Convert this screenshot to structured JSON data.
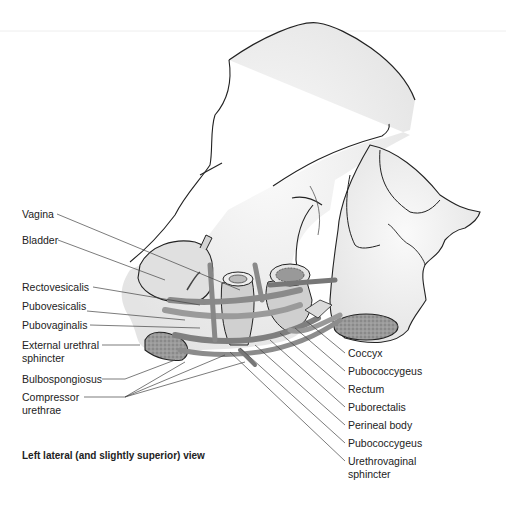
{
  "figure": {
    "caption": "Left lateral (and slightly superior) view",
    "labels_left": [
      {
        "text": "Vagina"
      },
      {
        "text": "Bladder"
      },
      {
        "text": "Rectovesicalis"
      },
      {
        "text": "Pubovesicalis"
      },
      {
        "text": "Pubovaginalis"
      },
      {
        "text": "External urethral\nsphincter"
      },
      {
        "text": "Bulbospongiosus"
      },
      {
        "text": "Compressor\nurethrae"
      }
    ],
    "labels_right": [
      {
        "text": "Coccyx"
      },
      {
        "text": "Pubococcygeus"
      },
      {
        "text": "Rectum"
      },
      {
        "text": "Puborectalis"
      },
      {
        "text": "Perineal body"
      },
      {
        "text": "Pubococcygeus"
      },
      {
        "text": "Urethrovaginal\nsphincter"
      }
    ],
    "colors": {
      "bone": "#f2f2f2",
      "outline": "#222222",
      "muscle": "#9a9a9a",
      "leader": "#444444"
    }
  }
}
